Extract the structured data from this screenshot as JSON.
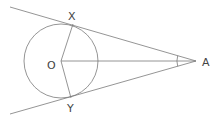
{
  "diagram": {
    "colors": {
      "stroke": "#7a7a7a",
      "label": "#444444",
      "background": "#ffffff"
    },
    "points": {
      "O": {
        "label": "O",
        "x": 61,
        "y": 61
      },
      "X": {
        "label": "X",
        "x": 73,
        "y": 24
      },
      "Y": {
        "label": "Y",
        "x": 71,
        "y": 98
      },
      "A": {
        "label": "A",
        "x": 196,
        "y": 61
      }
    },
    "circle": {
      "cx": 61,
      "cy": 61,
      "r": 37
    },
    "labels": {
      "O": "O",
      "X": "X",
      "Y": "Y",
      "A": "A"
    },
    "segments": [
      {
        "name": "tangent-AX",
        "from": [
          10,
          7
        ],
        "to": [
          196,
          61
        ]
      },
      {
        "name": "tangent-AY",
        "from": [
          10,
          114
        ],
        "to": [
          196,
          61
        ]
      },
      {
        "name": "radius-OX",
        "from": "O",
        "to": "X"
      },
      {
        "name": "radius-OY",
        "from": "O",
        "to": "Y"
      },
      {
        "name": "segment-OA",
        "from": "O",
        "to": "A"
      }
    ],
    "angle_marker": {
      "vertex": "A",
      "radius": 19
    }
  }
}
